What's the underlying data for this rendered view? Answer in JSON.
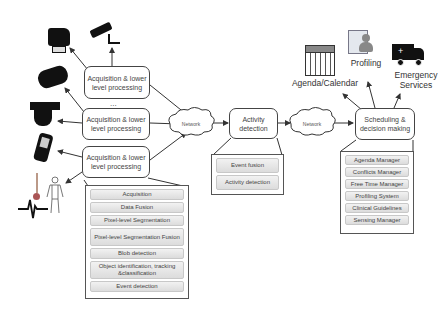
{
  "sensors": {
    "dots": "...",
    "acq_boxes": [
      {
        "label": "Acquisition & lower level processing"
      },
      {
        "label": "Acquisition & lower level processing"
      },
      {
        "label": "Acquisition & lower level processing"
      }
    ],
    "icons": [
      "camera-dome-icon",
      "cctv-camera-icon",
      "box-camera-icon",
      "ptz-camera-icon",
      "smartphone-icon",
      "thermometer-icon",
      "human-body-icon",
      "ecg-signal-icon"
    ]
  },
  "network_left": {
    "label": "Network"
  },
  "network_right": {
    "label": "Network"
  },
  "acq_panel": {
    "items": [
      "Acquisition",
      "Data Fusion",
      "Pixel-level Segmentation",
      "Pixel-level Segmentation Fusion",
      "Blob detection",
      "Object identification, tracking &classification",
      "Event detection"
    ]
  },
  "activity": {
    "label": "Activity detection",
    "panel_items": [
      "Event fusion",
      "Activity detection"
    ]
  },
  "scheduling": {
    "label": "Scheduling & decision making",
    "panel_items": [
      "Agenda Manager",
      "Conflicts Manager",
      "Free Time Manager",
      "Profiling System",
      "Clinical Guidelines",
      "Sensing Manager"
    ]
  },
  "outputs": {
    "agenda": "Agenda/Calendar",
    "profiling": "Profiling",
    "emergency": "Emergency Services"
  },
  "colors": {
    "line": "#333333",
    "panel_item_top": "#f2f2f2",
    "panel_item_bottom": "#dcdcdc"
  }
}
